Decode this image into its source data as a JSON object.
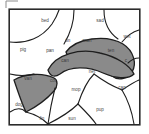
{
  "figure": {
    "type": "word-sort-region-diagram",
    "frame": {
      "border_color": "#2b2b2b",
      "background": "#ffffff"
    },
    "shaded_color": "#8a8a8a",
    "unshaded_color": "#ffffff",
    "line_color": "#1e1e1e",
    "label_color": "#4a4a4a"
  },
  "corner_mark": {
    "name": "corner-angle-mark",
    "visible": true
  },
  "regions": [
    {
      "id": "r-bed",
      "label": "bed",
      "shaded": false,
      "x": 45,
      "y": 21
    },
    {
      "id": "r-sad",
      "label": "sad",
      "shaded": false,
      "x": 100,
      "y": 21
    },
    {
      "id": "r-wet1",
      "label": "wet",
      "shaded": false,
      "x": 127,
      "y": 37
    },
    {
      "id": "r-pig",
      "label": "pig",
      "shaded": false,
      "x": 23,
      "y": 50
    },
    {
      "id": "r-tin",
      "label": "tin",
      "shaded": true,
      "x": 68,
      "y": 41
    },
    {
      "id": "r-man",
      "label": "man",
      "shaded": true,
      "x": 87,
      "y": 41
    },
    {
      "id": "r-pan",
      "label": "pan",
      "shaded": true,
      "x": 50,
      "y": 51
    },
    {
      "id": "r-ten",
      "label": "ten",
      "shaded": true,
      "x": 111,
      "y": 51
    },
    {
      "id": "r-can",
      "label": "can",
      "shaded": true,
      "x": 65,
      "y": 61
    },
    {
      "id": "r-dot",
      "label": "c",
      "shaded": true,
      "x": 126,
      "y": 61
    },
    {
      "id": "r-van",
      "label": "van",
      "shaded": true,
      "x": 28,
      "y": 79
    },
    {
      "id": "r-cot",
      "label": "cot",
      "shaded": false,
      "x": 53,
      "y": 81
    },
    {
      "id": "r-net",
      "label": "net",
      "shaded": false,
      "x": 92,
      "y": 72
    },
    {
      "id": "r-mop",
      "label": "mop",
      "shaded": false,
      "x": 76,
      "y": 90
    },
    {
      "id": "r-cap",
      "label": "cap",
      "shaded": false,
      "x": 122,
      "y": 88
    },
    {
      "id": "r-dog",
      "label": "dog",
      "shaded": false,
      "x": 19,
      "y": 105
    },
    {
      "id": "r-pup",
      "label": "pup",
      "shaded": false,
      "x": 100,
      "y": 110
    },
    {
      "id": "r-fin",
      "label": "fin",
      "shaded": false,
      "x": 42,
      "y": 119
    },
    {
      "id": "r-sun",
      "label": "sun",
      "shaded": false,
      "x": 72,
      "y": 119
    }
  ]
}
